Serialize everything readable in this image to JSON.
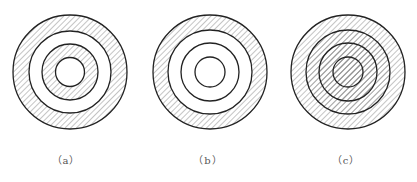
{
  "figure": {
    "stroke_color": "#222222",
    "hatch_color": "#8a8a8a",
    "panels": [
      {
        "id": "a",
        "label": "（a）",
        "cx": 70,
        "cy": 72,
        "radii": [
          57,
          41,
          28,
          14.5
        ],
        "hatched_bands": [
          "outer",
          "third"
        ],
        "description": "Outer band hatched, second band blank, third band hatched, inner disc blank"
      },
      {
        "id": "b",
        "label": "（b）",
        "cx": 210,
        "cy": 72,
        "radii": [
          57,
          42,
          29,
          15
        ],
        "hatched_bands": [
          "outer"
        ],
        "description": "Only outer band hatched, all inner bands blank"
      },
      {
        "id": "c",
        "label": "（c）",
        "cx": 348,
        "cy": 72,
        "radii": [
          57,
          42,
          29,
          15
        ],
        "hatched_bands": [
          "outer",
          "second",
          "third",
          "inner"
        ],
        "description": "All bands hatched including inner disc"
      }
    ]
  }
}
